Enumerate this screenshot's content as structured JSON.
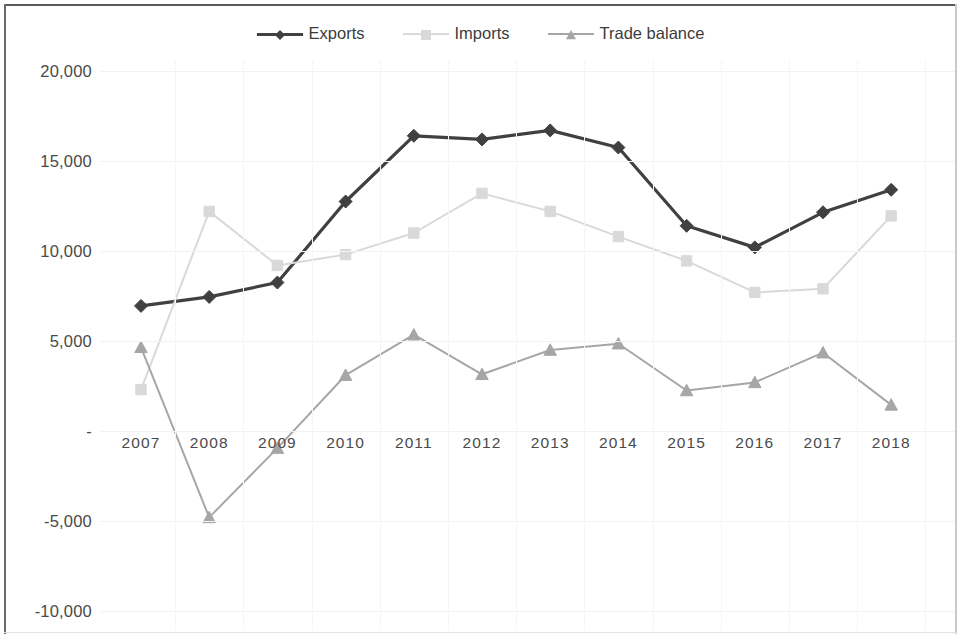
{
  "chart_data": {
    "type": "line",
    "title": "",
    "subtitle": "",
    "xlabel": "",
    "ylabel": "",
    "categories": [
      "2007",
      "2008",
      "2009",
      "2010",
      "2011",
      "2012",
      "2013",
      "2014",
      "2015",
      "2016",
      "2017",
      "2018"
    ],
    "ylim": [
      -10000,
      20000
    ],
    "ytick_values": [
      20000,
      15000,
      10000,
      5000,
      0,
      -5000,
      -10000
    ],
    "ytick_labels": [
      "20,000",
      "15,000",
      "10,000",
      "5,000",
      "-",
      "-5,000",
      "-10,000"
    ],
    "grid": true,
    "legend_position": "top-center",
    "series": [
      {
        "name": "Exports",
        "color": "#404040",
        "marker": "diamond",
        "values": [
          6950,
          7450,
          8250,
          12750,
          16400,
          16200,
          16700,
          15750,
          11400,
          10200,
          12150,
          13400
        ]
      },
      {
        "name": "Imports",
        "color": "#d9d9d9",
        "marker": "square",
        "values": [
          2300,
          12200,
          9200,
          9800,
          11000,
          13200,
          12200,
          10800,
          9450,
          7700,
          7900,
          11950
        ]
      },
      {
        "name": "Trade balance",
        "color": "#a6a6a6",
        "marker": "triangle",
        "values": [
          4650,
          -4800,
          -950,
          3100,
          5350,
          3150,
          4500,
          4850,
          2250,
          2700,
          4350,
          1450
        ]
      }
    ]
  },
  "legend": {
    "items": [
      {
        "label": "Exports"
      },
      {
        "label": "Imports"
      },
      {
        "label": "Trade balance"
      }
    ]
  },
  "axes": {
    "y_labels": [
      "20,000",
      "15,000",
      "10,000",
      "5,000",
      "-",
      "-5,000",
      "-10,000"
    ],
    "x_labels": [
      "2007",
      "2008",
      "2009",
      "2010",
      "2011",
      "2012",
      "2013",
      "2014",
      "2015",
      "2016",
      "2017",
      "2018"
    ]
  },
  "colors": {
    "exports": "#404040",
    "imports": "#d9d9d9",
    "trade_balance": "#a6a6a6",
    "axis_text": "#4a4a4a",
    "grid": "#f2f2f2",
    "background": "#ffffff"
  }
}
